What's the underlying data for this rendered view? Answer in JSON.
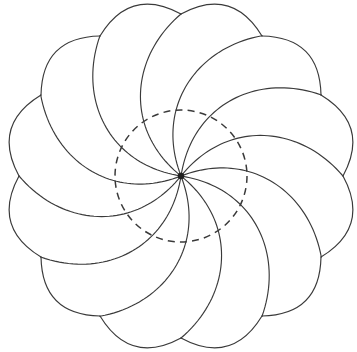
{
  "figure": {
    "background_color": "#ffffff",
    "stroke_color": "#3a3a3a",
    "hub_color": "#1f1f1f",
    "width": 357,
    "height": 352
  },
  "chart_data": {
    "type": "scatter",
    "xlabel": "",
    "ylabel": "",
    "grid": false,
    "legend": null,
    "geometry": {
      "center_x": 181,
      "center_y": 176,
      "outer_radius": 162,
      "inner_dashed_radius": 66,
      "petal_count": 12,
      "spoke_count": 12,
      "rotation_offset_deg": -90,
      "spiral_sweep_deg": 62,
      "outer_arc_bulge": 0.17,
      "hub_radius": 3.2,
      "handedness": "clockwise"
    },
    "cusp_angles_deg": [
      -90,
      -60,
      -30,
      0,
      30,
      60,
      90,
      120,
      150,
      180,
      210,
      240
    ],
    "cusp_points": [
      {
        "index": 0,
        "angle_deg": -90,
        "x": 181,
        "y": 14
      },
      {
        "index": 1,
        "angle_deg": -60,
        "x": 262,
        "y": 36
      },
      {
        "index": 2,
        "angle_deg": -30,
        "x": 321,
        "y": 95
      },
      {
        "index": 3,
        "angle_deg": 0,
        "x": 343,
        "y": 176
      },
      {
        "index": 4,
        "angle_deg": 30,
        "x": 321,
        "y": 257
      },
      {
        "index": 5,
        "angle_deg": 60,
        "x": 262,
        "y": 316
      },
      {
        "index": 6,
        "angle_deg": 90,
        "x": 181,
        "y": 338
      },
      {
        "index": 7,
        "angle_deg": 120,
        "x": 100,
        "y": 316
      },
      {
        "index": 8,
        "angle_deg": 150,
        "x": 41,
        "y": 257
      },
      {
        "index": 9,
        "angle_deg": 180,
        "x": 19,
        "y": 176
      },
      {
        "index": 10,
        "angle_deg": 210,
        "x": 41,
        "y": 95
      },
      {
        "index": 11,
        "angle_deg": 240,
        "x": 100,
        "y": 36
      }
    ],
    "bounding_box": {
      "x_min": 19,
      "x_max": 343,
      "y_min": 14,
      "y_max": 338
    }
  }
}
